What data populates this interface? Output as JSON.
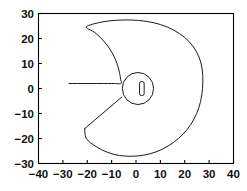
{
  "chart_data": {
    "type": "line",
    "title": "",
    "subtitle": "",
    "xlabel": "",
    "ylabel": "",
    "xlim": [
      -40,
      40
    ],
    "ylim": [
      -30,
      30
    ],
    "grid": false,
    "legend": false,
    "legend_position": "none",
    "axis": {
      "x_ticks": [
        -40,
        -30,
        -20,
        -10,
        0,
        10,
        20,
        30,
        40
      ],
      "x_tick_labels": [
        "−40",
        "−30",
        "−20",
        "−10",
        "0",
        "10",
        "20",
        "30",
        "40"
      ],
      "y_ticks": [
        -30,
        -20,
        -10,
        0,
        10,
        20,
        30
      ],
      "y_tick_labels": [
        "−30",
        "−20",
        "−10",
        "0",
        "10",
        "20",
        "30"
      ],
      "tick_direction": "in",
      "frame": "box",
      "line_color": "#000000"
    },
    "series": [
      {
        "name": "outer-spiral-boundary",
        "closed": false,
        "color": "#000000",
        "linewidth": 0.9,
        "comment": "Keyhole-shaped outer contour: large spiral arc opening to the left, with a horizontal slit at y=2 and a diagonal cut to (-21,-16)",
        "points": [
          [
            -27.5,
            2.0
          ],
          [
            -10.0,
            2.0
          ],
          [
            -6.2,
            2.0
          ],
          [
            -6.3,
            3.6
          ],
          [
            -6.8,
            6.5
          ],
          [
            -7.8,
            10.0
          ],
          [
            -9.4,
            13.6
          ],
          [
            -11.6,
            17.0
          ],
          [
            -14.2,
            20.0
          ],
          [
            -17.2,
            22.6
          ],
          [
            -20.4,
            24.7
          ],
          [
            -14.0,
            26.6
          ],
          [
            -8.0,
            27.3
          ],
          [
            -2.0,
            27.4
          ],
          [
            4.0,
            26.9
          ],
          [
            10.0,
            25.6
          ],
          [
            15.4,
            23.4
          ],
          [
            20.0,
            20.4
          ],
          [
            23.6,
            16.6
          ],
          [
            26.0,
            12.2
          ],
          [
            27.2,
            7.4
          ],
          [
            27.4,
            2.4
          ],
          [
            27.0,
            -2.6
          ],
          [
            25.8,
            -7.6
          ],
          [
            23.8,
            -12.2
          ],
          [
            21.0,
            -16.4
          ],
          [
            17.4,
            -20.0
          ],
          [
            13.2,
            -23.0
          ],
          [
            8.6,
            -25.2
          ],
          [
            3.6,
            -26.6
          ],
          [
            -1.6,
            -27.1
          ],
          [
            -6.8,
            -26.8
          ],
          [
            -11.8,
            -25.5
          ],
          [
            -16.4,
            -23.2
          ],
          [
            -20.4,
            -20.0
          ],
          [
            -21.0,
            -16.0
          ]
        ]
      },
      {
        "name": "diagonal-cut",
        "closed": false,
        "color": "#000000",
        "linewidth": 0.9,
        "comment": "Straight segment from lower-left vertex up to the inner circle",
        "points": [
          [
            -21.0,
            -16.0
          ],
          [
            -5.8,
            -3.4
          ]
        ]
      },
      {
        "name": "inner-circle",
        "closed": true,
        "color": "#000000",
        "linewidth": 0.9,
        "shape": "circle",
        "center": [
          0.8,
          0.0
        ],
        "radius": 6.4,
        "comment": "Small circle at origin joining the slit and the diagonal cut"
      },
      {
        "name": "inner-slot",
        "closed": true,
        "color": "#000000",
        "linewidth": 0.9,
        "shape": "rounded-rect",
        "center": [
          2.4,
          0.0
        ],
        "width": 1.9,
        "height": 5.6,
        "corner_radius": 0.8,
        "comment": "Narrow vertical rounded slot inside the small circle"
      }
    ]
  },
  "figure": {
    "background": "#ffffff",
    "foreground": "#000000"
  }
}
